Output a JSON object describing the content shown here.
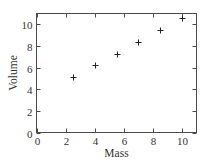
{
  "chart_data": {
    "type": "scatter",
    "title": "",
    "xlabel": "Mass",
    "ylabel": "Volume",
    "xlim": [
      0,
      11
    ],
    "ylim": [
      0,
      11
    ],
    "xticks": [
      0,
      2,
      4,
      6,
      8,
      10
    ],
    "yticks": [
      0,
      2,
      4,
      6,
      8,
      10
    ],
    "xtick_labels": [
      "0",
      "2",
      "4",
      "6",
      "8",
      "10"
    ],
    "ytick_labels": [
      "0",
      "2",
      "4",
      "6",
      "8",
      "10"
    ],
    "grid": false,
    "marker": "plus",
    "ticks_direction": "inward",
    "box": true,
    "series": [
      {
        "name": "data",
        "x": [
          2.5,
          4,
          5.5,
          7,
          8.5,
          10
        ],
        "y": [
          5.1,
          6.2,
          7.3,
          8.4,
          9.5,
          10.6
        ]
      }
    ]
  }
}
